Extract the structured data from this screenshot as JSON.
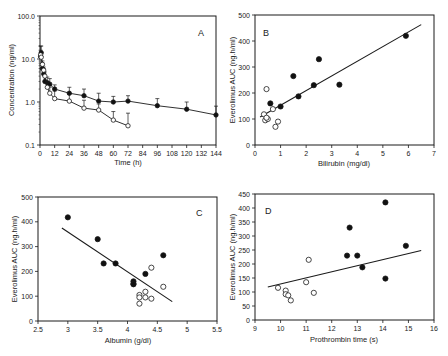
{
  "figure": {
    "colors": {
      "ink": "#1a1a1a",
      "filled_marker": "#111111",
      "open_marker_fill": "#ffffff",
      "background": "#ffffff"
    }
  },
  "chart_data": [
    {
      "panel": "A",
      "type": "line",
      "xlabel": "Time (h)",
      "ylabel": "Concentration (ng/ml)",
      "yscale": "log",
      "xlim": [
        0,
        144
      ],
      "ylim": [
        0.1,
        100
      ],
      "xticks": [
        0,
        12,
        24,
        36,
        48,
        60,
        72,
        84,
        96,
        108,
        120,
        132,
        144
      ],
      "yticks": [
        0.1,
        1.0,
        10.0,
        100.0
      ],
      "ytick_labels": [
        "0.1",
        "1.0",
        "10.0",
        "100.0"
      ],
      "grid": false,
      "series": [
        {
          "name": "filled",
          "marker": "filled-circle",
          "x": [
            0.5,
            1,
            2,
            3,
            4,
            6,
            8,
            12,
            24,
            36,
            48,
            60,
            72,
            96,
            120,
            144
          ],
          "y": [
            11.5,
            14.0,
            6.0,
            4.5,
            3.0,
            2.8,
            2.6,
            2.0,
            1.6,
            1.4,
            1.05,
            1.0,
            1.05,
            0.82,
            0.68,
            0.5
          ],
          "error_up": [
            20,
            20,
            8,
            6,
            4,
            3.8,
            3.5,
            2.5,
            2.2,
            2.0,
            1.6,
            1.35,
            1.4,
            1.2,
            1.0,
            0.8
          ]
        },
        {
          "name": "open",
          "marker": "open-circle",
          "x": [
            0.5,
            1,
            2,
            3,
            4,
            6,
            8,
            12,
            24,
            36,
            48,
            60,
            72
          ],
          "y": [
            12.5,
            11.0,
            7.5,
            5.5,
            4.0,
            2.2,
            1.6,
            1.2,
            1.05,
            0.72,
            0.65,
            0.38,
            0.28
          ],
          "error_up": [
            16,
            14,
            9,
            6.5,
            5,
            3,
            2.2,
            1.8,
            1.5,
            1.1,
            0.9,
            0.6,
            0.55
          ]
        }
      ]
    },
    {
      "panel": "B",
      "type": "scatter",
      "xlabel": "Bilirubin (mg/dl)",
      "ylabel": "Everolimus AUC (ng.h/ml)",
      "xlim": [
        0,
        7
      ],
      "ylim": [
        0,
        500
      ],
      "xticks": [
        0,
        1,
        2,
        3,
        4,
        5,
        6,
        7
      ],
      "yticks": [
        0,
        100,
        200,
        300,
        400,
        500
      ],
      "grid": false,
      "series": [
        {
          "name": "filled",
          "marker": "filled-circle",
          "x": [
            0.6,
            1.0,
            1.5,
            1.7,
            2.3,
            2.5,
            3.3,
            5.9
          ],
          "y": [
            160,
            148,
            265,
            187,
            230,
            330,
            232,
            420
          ]
        },
        {
          "name": "open",
          "marker": "open-circle",
          "x": [
            0.45,
            0.35,
            0.4,
            0.5,
            0.45,
            0.7,
            0.8,
            0.9
          ],
          "y": [
            215,
            118,
            95,
            100,
            105,
            138,
            70,
            90
          ]
        }
      ],
      "fit_line": {
        "x": [
          0.2,
          6.5
        ],
        "y": [
          108,
          463
        ]
      }
    },
    {
      "panel": "C",
      "type": "scatter",
      "xlabel": "Albumin (g/dl)",
      "ylabel": "Everolimus AUC (ng.h/ml)",
      "xlim": [
        2.5,
        5.5
      ],
      "ylim": [
        0,
        500
      ],
      "xticks": [
        2.5,
        3,
        3.5,
        4,
        4.5,
        5,
        5.5
      ],
      "yticks": [
        0,
        100,
        200,
        300,
        400,
        500
      ],
      "grid": false,
      "series": [
        {
          "name": "filled",
          "marker": "filled-circle",
          "x": [
            3.0,
            3.5,
            3.6,
            3.8,
            4.1,
            4.1,
            4.1,
            4.3,
            4.6
          ],
          "y": [
            418,
            330,
            232,
            232,
            160,
            150,
            148,
            190,
            265
          ]
        },
        {
          "name": "open",
          "marker": "open-circle",
          "x": [
            4.2,
            4.2,
            4.2,
            4.3,
            4.3,
            4.4,
            4.4,
            4.6
          ],
          "y": [
            105,
            95,
            70,
            118,
            95,
            90,
            215,
            138
          ]
        }
      ],
      "fit_line": {
        "x": [
          2.9,
          4.75
        ],
        "y": [
          375,
          78
        ]
      }
    },
    {
      "panel": "D",
      "type": "scatter",
      "xlabel": "Prothrombin time (s)",
      "ylabel": "Everolimus AUC (ng.h/ml)",
      "xlim": [
        9,
        16
      ],
      "ylim": [
        0,
        450
      ],
      "xticks": [
        9,
        10,
        11,
        12,
        13,
        14,
        15,
        16
      ],
      "yticks": [
        0,
        50,
        100,
        150,
        200,
        250,
        300,
        350,
        400,
        450
      ],
      "grid": false,
      "series": [
        {
          "name": "filled",
          "marker": "filled-circle",
          "x": [
            12.6,
            12.7,
            13.0,
            13.2,
            14.1,
            14.1,
            14.9
          ],
          "y": [
            230,
            330,
            230,
            188,
            420,
            148,
            265
          ]
        },
        {
          "name": "open",
          "marker": "open-circle",
          "x": [
            9.9,
            10.2,
            10.2,
            10.3,
            10.4,
            11.0,
            11.1,
            11.3
          ],
          "y": [
            115,
            105,
            92,
            88,
            70,
            135,
            215,
            97
          ]
        }
      ],
      "fit_line": {
        "x": [
          9.5,
          15.5
        ],
        "y": [
          118,
          248
        ]
      }
    }
  ],
  "panels": {
    "A": {
      "label": "A",
      "xlabel": "Time (h)",
      "ylabel": "Concentration (ng/ml)"
    },
    "B": {
      "label": "B",
      "xlabel": "Bilirubin (mg/dl)",
      "ylabel": "Everolimus AUC (ng.h/ml)"
    },
    "C": {
      "label": "C",
      "xlabel": "Albumin (g/dl)",
      "ylabel": "Everolimus AUC (ng.h/ml)"
    },
    "D": {
      "label": "D",
      "xlabel": "Prothrombin time (s)",
      "ylabel": "Everolimus AUC (ng.h/ml)"
    }
  }
}
